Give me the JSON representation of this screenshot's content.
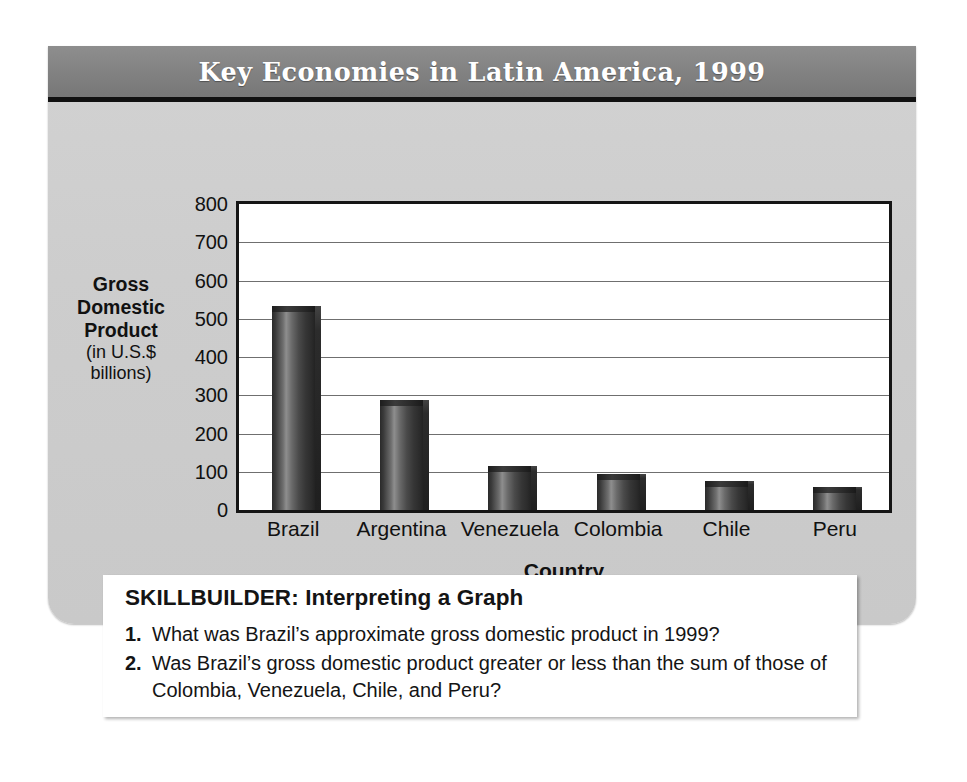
{
  "figure": {
    "title": "Key Economies in Latin America, 1999",
    "banner_color": "#818181",
    "card_color": "#cdcdcd"
  },
  "chart_data": {
    "type": "bar",
    "title": "Key Economies in Latin America, 1999",
    "xlabel": "Country",
    "ylabel": "Gross Domestic Product (in U.S.$ billions)",
    "ylabel_lines_bold": [
      "Gross",
      "Domestic",
      "Product"
    ],
    "ylabel_lines_plain": [
      "(in U.S.$",
      "billions)"
    ],
    "categories": [
      "Brazil",
      "Argentina",
      "Venezuela",
      "Colombia",
      "Chile",
      "Peru"
    ],
    "values": [
      520,
      275,
      103,
      82,
      63,
      48
    ],
    "yticks": [
      0,
      100,
      200,
      300,
      400,
      500,
      600,
      700,
      800
    ],
    "ylim": [
      0,
      800
    ],
    "grid": true,
    "legend": "none",
    "bar_color": "#3a3a3a"
  },
  "skillbuilder": {
    "heading": "SKILLBUILDER: Interpreting a Graph",
    "questions": [
      {
        "number": "1.",
        "text": "What was Brazil’s approximate gross domestic product in 1999?"
      },
      {
        "number": "2.",
        "text": "Was Brazil’s gross domestic product greater or less than the sum of those of Colombia, Venezuela, Chile, and Peru?"
      }
    ]
  }
}
